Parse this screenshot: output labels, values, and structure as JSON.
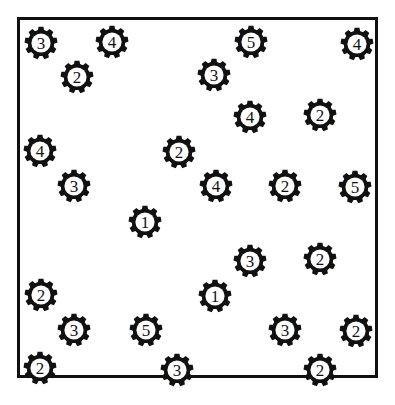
{
  "title": "RESULTS",
  "frame": {
    "name": "field-border",
    "stroke_color": "#111111",
    "background_color": "#ffffff",
    "x": 17,
    "y": 17,
    "width": 361,
    "height": 361
  },
  "legend": {
    "token_icon": "gear-icon",
    "token_color": "#111111",
    "token_fill": "#ffffff"
  },
  "chart_data": {
    "type": "scatter",
    "title": "RESULTS",
    "xlabel": "",
    "ylabel": "",
    "xlim": [
      0,
      395
    ],
    "ylim": [
      0,
      405
    ],
    "grid": false,
    "legend_position": "none",
    "point_marker": "gear",
    "label_counts": {
      "1": 2,
      "2": 9,
      "3": 8,
      "4": 5,
      "5": 3
    },
    "total_points": 27,
    "points": [
      {
        "label": "3",
        "x": 41,
        "y": 43
      },
      {
        "label": "4",
        "x": 112,
        "y": 42
      },
      {
        "label": "5",
        "x": 251,
        "y": 42
      },
      {
        "label": "4",
        "x": 357,
        "y": 44
      },
      {
        "label": "2",
        "x": 77,
        "y": 77
      },
      {
        "label": "3",
        "x": 214,
        "y": 75
      },
      {
        "label": "4",
        "x": 250,
        "y": 117
      },
      {
        "label": "2",
        "x": 320,
        "y": 115
      },
      {
        "label": "4",
        "x": 40,
        "y": 151
      },
      {
        "label": "2",
        "x": 179,
        "y": 152
      },
      {
        "label": "3",
        "x": 74,
        "y": 186
      },
      {
        "label": "4",
        "x": 216,
        "y": 186
      },
      {
        "label": "2",
        "x": 285,
        "y": 186
      },
      {
        "label": "5",
        "x": 355,
        "y": 187
      },
      {
        "label": "1",
        "x": 145,
        "y": 222
      },
      {
        "label": "3",
        "x": 250,
        "y": 261
      },
      {
        "label": "2",
        "x": 320,
        "y": 259
      },
      {
        "label": "2",
        "x": 41,
        "y": 295
      },
      {
        "label": "1",
        "x": 215,
        "y": 296
      },
      {
        "label": "3",
        "x": 74,
        "y": 330
      },
      {
        "label": "5",
        "x": 146,
        "y": 330
      },
      {
        "label": "3",
        "x": 285,
        "y": 330
      },
      {
        "label": "2",
        "x": 356,
        "y": 331
      },
      {
        "label": "2",
        "x": 40,
        "y": 368
      },
      {
        "label": "3",
        "x": 177,
        "y": 370
      },
      {
        "label": "2",
        "x": 320,
        "y": 370
      }
    ]
  }
}
